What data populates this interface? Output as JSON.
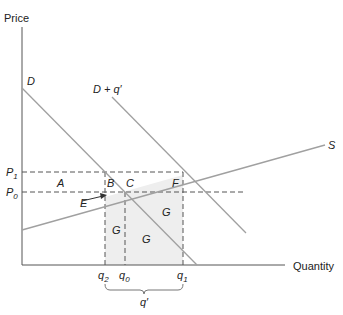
{
  "diagram": {
    "axes": {
      "y_label": "Price",
      "x_label": "Quantity"
    },
    "curves": {
      "demand": "D",
      "shifted_demand": "D + q′",
      "supply": "S"
    },
    "price_ticks": {
      "p1": {
        "base": "P",
        "sub": "1"
      },
      "p0": {
        "base": "P",
        "sub": "0"
      }
    },
    "quantity_ticks": {
      "q2": {
        "base": "q",
        "sub": "2"
      },
      "q0": {
        "base": "q",
        "sub": "0"
      },
      "q1": {
        "base": "q",
        "sub": "1"
      }
    },
    "bracket_label": "q′",
    "regions": {
      "a": "A",
      "b": "B",
      "c": "C",
      "e": "E",
      "f": "F",
      "g1": "G",
      "g2": "G",
      "g3": "G"
    },
    "colors": {
      "axis": "#555555",
      "curve": "#a0a0a0",
      "dash": "#555555",
      "shade": "#eeeeee",
      "text": "#222222"
    }
  }
}
